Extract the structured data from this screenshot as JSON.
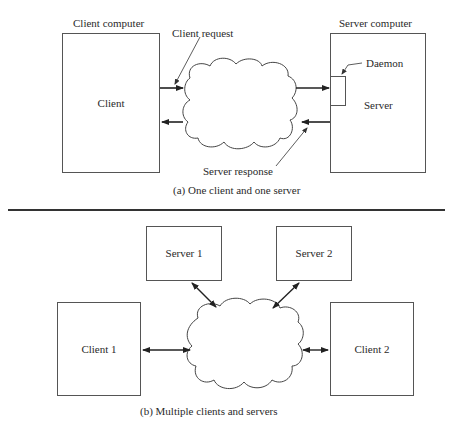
{
  "panel_a": {
    "client_computer_label": "Client computer",
    "client_label": "Client",
    "client_request_label": "Client request",
    "internet_label": "Internet",
    "server_computer_label": "Server computer",
    "daemon_label": "Daemon",
    "server_label": "Server",
    "server_response_label": "Server response",
    "caption": "(a) One client and one server"
  },
  "panel_b": {
    "server1_label": "Server 1",
    "server2_label": "Server 2",
    "client1_label": "Client 1",
    "client2_label": "Client 2",
    "internet_label": "Internet",
    "caption": "(b) Multiple clients and servers"
  }
}
